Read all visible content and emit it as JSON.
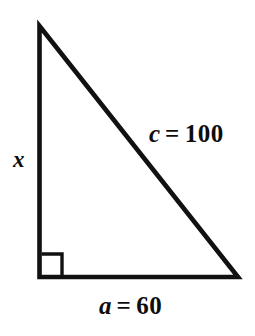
{
  "figure": {
    "type": "right-triangle-diagram",
    "background_color": "#ffffff",
    "stroke_color": "#111111",
    "stroke_width_px": 4.5,
    "vertices": {
      "apex": [
        39,
        26
      ],
      "bottom_left": [
        39,
        277
      ],
      "bottom_right": [
        238,
        277
      ]
    },
    "right_angle_marker": {
      "at_vertex": "bottom_left",
      "size_px": 22,
      "stroke_width_px": 3.5
    },
    "labels": {
      "vertical_leg": {
        "variable": "x",
        "text": "x",
        "position": [
          15,
          152
        ],
        "style": "bold-italic"
      },
      "hypotenuse": {
        "variable": "c",
        "value": "100",
        "equals": "=",
        "text": "c = 100",
        "position": [
          150,
          124
        ],
        "style": "bold, variable italic"
      },
      "base": {
        "variable": "a",
        "value": "60",
        "equals": "=",
        "text": "a = 60",
        "position": [
          100,
          296
        ],
        "style": "bold, variable italic"
      }
    }
  }
}
